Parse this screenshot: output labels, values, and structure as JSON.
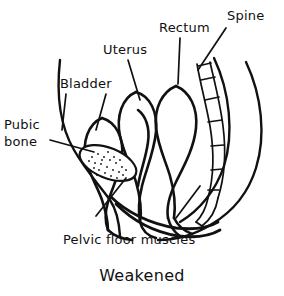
{
  "figure": {
    "caption": "Weakened",
    "clipped_top_text": "Prolapse",
    "ink_color": "#111111",
    "background_color": "#ffffff"
  },
  "labels": [
    {
      "id": "pubic-bone",
      "line1": "Pubic",
      "line2": "bone"
    },
    {
      "id": "bladder",
      "text": "Bladder"
    },
    {
      "id": "uterus",
      "text": "Uterus"
    },
    {
      "id": "rectum",
      "text": "Rectum"
    },
    {
      "id": "spine",
      "text": "Spine"
    },
    {
      "id": "pelvic-floor-muscles",
      "text": "Pelvic floor muscles"
    }
  ],
  "anatomy": {
    "structures": [
      "abdominal-wall",
      "pubic-bone",
      "bladder",
      "uterus",
      "rectum",
      "spine",
      "pelvic-floor-muscles",
      "buttock-outline"
    ]
  }
}
